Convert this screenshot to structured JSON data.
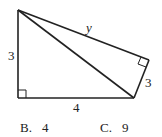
{
  "diagram": {
    "labels": {
      "left_side": "3",
      "hypotenuse_top": "y",
      "right_side": "3",
      "bottom_side": "4"
    },
    "right_angle_markers": [
      "bottom-left",
      "right-vertex"
    ]
  },
  "options": [
    {
      "letter": "B.",
      "value": "4"
    },
    {
      "letter": "C.",
      "value": "9"
    }
  ]
}
